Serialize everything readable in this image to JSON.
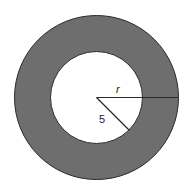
{
  "diagram": {
    "colors": {
      "ring_fill": "#6e6e6e",
      "inner_fill": "#ffffff",
      "stroke": "#2a2a2a",
      "background": "#ffffff"
    },
    "outer_circle": {
      "cx": 96.5,
      "cy": 97.5,
      "r": 82
    },
    "inner_circle": {
      "cx": 96.5,
      "cy": 97.5,
      "r": 46
    },
    "labels": {
      "outer_radius": "r",
      "inner_radius": "5"
    }
  }
}
